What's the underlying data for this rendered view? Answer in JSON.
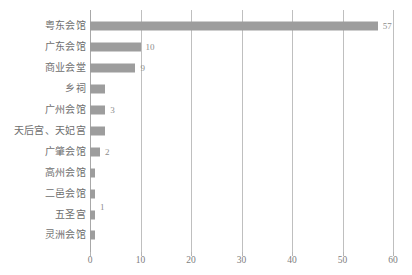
{
  "chart_data": {
    "type": "bar",
    "orientation": "horizontal",
    "title": "",
    "subtitle": "",
    "xlabel": "",
    "ylabel": "",
    "xlim": [
      0,
      60
    ],
    "xticks": [
      0,
      10,
      20,
      30,
      40,
      50,
      60
    ],
    "grid": true,
    "legend": false,
    "bar_color": "#9d9d9d",
    "gridline_color": "#bfbfbf",
    "text_color": "#6e6e6e",
    "categories": [
      "粤东会馆",
      "广东会馆",
      "商业会堂",
      "乡祠",
      "广州会馆",
      "天后宫、天妃宫",
      "广肇会馆",
      "高州会馆",
      "二邑会馆",
      "五圣宫",
      "灵洲会馆"
    ],
    "values": [
      57,
      10,
      9,
      3,
      3,
      3,
      2,
      1,
      1,
      1,
      1
    ],
    "data_labels": [
      "57",
      "10",
      "9",
      "",
      "3",
      "",
      "2",
      "",
      "",
      "1",
      ""
    ]
  }
}
